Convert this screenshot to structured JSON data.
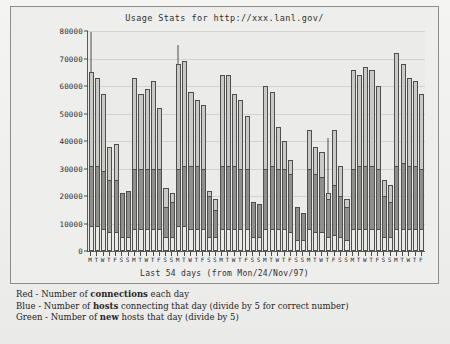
{
  "chart_data": {
    "type": "bar",
    "title": "Usage Stats for http://xxx.lanl.gov/",
    "xlabel": "Last 54 days (from Mon/24/Nov/97)",
    "ylabel": "",
    "ylim": [
      0,
      80000
    ],
    "grid": true,
    "legend_position": "below-figure",
    "yticks": [
      0,
      10000,
      20000,
      30000,
      40000,
      50000,
      60000,
      70000,
      80000
    ],
    "ytick_labels": [
      "0",
      "10000",
      "20000",
      "30000",
      "40000",
      "50000",
      "60000",
      "70000",
      "80000"
    ],
    "categories": [
      "M",
      "T",
      "W",
      "T",
      "F",
      "S",
      "S",
      "M",
      "T",
      "W",
      "T",
      "F",
      "S",
      "S",
      "M",
      "T",
      "W",
      "T",
      "F",
      "S",
      "S",
      "M",
      "T",
      "W",
      "T",
      "F",
      "S",
      "S",
      "M",
      "T",
      "W",
      "T",
      "F",
      "S",
      "S",
      "M",
      "T",
      "W",
      "T",
      "F",
      "S",
      "S",
      "M",
      "T",
      "W",
      "T",
      "F",
      "S",
      "S",
      "M",
      "T",
      "W",
      "T",
      "F"
    ],
    "series": [
      {
        "name": "Red - Number of connections each day",
        "key": "connections",
        "color": "#c9c9c6",
        "values": [
          65000,
          63000,
          57000,
          38000,
          39000,
          18000,
          16000,
          63000,
          57000,
          59000,
          62000,
          52000,
          23000,
          21000,
          68000,
          69000,
          58000,
          55000,
          53000,
          22000,
          19000,
          64000,
          64000,
          57000,
          55000,
          49000,
          18000,
          17000,
          60000,
          58000,
          45000,
          40000,
          33000,
          14000,
          13000,
          44000,
          38000,
          36000,
          21000,
          44000,
          31000,
          19000,
          66000,
          64000,
          67000,
          66000,
          60000,
          26000,
          24000,
          72000,
          68000,
          63000,
          62000,
          57000
        ]
      },
      {
        "name": "Blue - Number of hosts connecting that day (divide by 5 for correct number)",
        "key": "hosts",
        "color": "#8f8f8c",
        "values": [
          31000,
          31000,
          29000,
          26000,
          26000,
          21000,
          22000,
          30000,
          30000,
          30000,
          30000,
          30000,
          16000,
          18000,
          30000,
          31000,
          31000,
          31000,
          30000,
          20000,
          15000,
          31000,
          31000,
          31000,
          30000,
          30000,
          18000,
          17000,
          30000,
          31000,
          30000,
          30000,
          28000,
          16000,
          14000,
          30000,
          28000,
          27000,
          19000,
          24000,
          20000,
          16000,
          30000,
          31000,
          31000,
          31000,
          30000,
          20000,
          18000,
          31000,
          32000,
          31000,
          31000,
          30000
        ]
      },
      {
        "name": "Green - Number of new hosts that day (divide by 5)",
        "key": "new_hosts",
        "color": "#e8e8e4",
        "values": [
          9000,
          9000,
          8000,
          7000,
          7000,
          5000,
          5000,
          8000,
          8000,
          8000,
          8000,
          8000,
          5000,
          5000,
          9000,
          9000,
          8000,
          8000,
          8000,
          5000,
          5000,
          8000,
          8000,
          8000,
          8000,
          8000,
          5000,
          5000,
          8000,
          8000,
          8000,
          8000,
          7000,
          4000,
          4000,
          8000,
          7000,
          7000,
          5000,
          6000,
          5000,
          4000,
          8000,
          8000,
          8000,
          8000,
          8000,
          5000,
          5000,
          8000,
          8000,
          8000,
          8000,
          8000
        ]
      }
    ],
    "spikes": [
      {
        "index": 0,
        "top": 79500
      },
      {
        "index": 14,
        "top": 75000
      },
      {
        "index": 38,
        "top": 41000
      }
    ]
  },
  "legend": {
    "rows": [
      {
        "prefix": "Red - Number of ",
        "emphasis": "connections",
        "suffix": " each day"
      },
      {
        "prefix": "Blue - Number of ",
        "emphasis": "hosts",
        "suffix": " connecting that day (divide by 5 for correct number)"
      },
      {
        "prefix": "Green - Number of ",
        "emphasis": "new",
        "suffix": " hosts that day (divide by 5)"
      }
    ]
  }
}
